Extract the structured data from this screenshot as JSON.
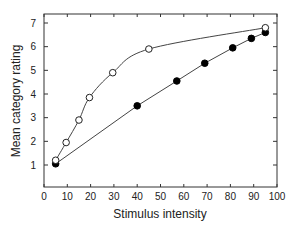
{
  "chart_data": {
    "type": "line",
    "title": "",
    "xlabel": "Stimulus intensity",
    "ylabel": "Mean category rating",
    "xlim": [
      0,
      100
    ],
    "ylim": [
      0,
      7.4
    ],
    "xticks": [
      0,
      10,
      20,
      30,
      40,
      50,
      60,
      70,
      80,
      90,
      100
    ],
    "yticks": [
      1,
      2,
      3,
      4,
      5,
      6,
      7
    ],
    "grid": false,
    "legend": null,
    "series": [
      {
        "name": "open circles",
        "marker": "open-circle",
        "x": [
          5,
          9.5,
          15,
          19.5,
          29.5,
          45,
          95
        ],
        "y": [
          1.2,
          1.95,
          2.9,
          3.85,
          4.9,
          5.9,
          6.8
        ]
      },
      {
        "name": "filled circles",
        "marker": "filled-circle",
        "x": [
          5,
          40,
          57,
          69,
          81,
          89,
          95
        ],
        "y": [
          1.05,
          3.5,
          4.55,
          5.3,
          5.95,
          6.35,
          6.6
        ]
      }
    ]
  }
}
